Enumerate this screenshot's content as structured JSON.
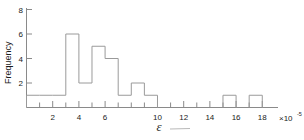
{
  "chart_data": {
    "type": "bar",
    "title": "",
    "subtitle": "",
    "xlabel": "ε",
    "ylabel": "Frequency",
    "x_multiplier": "×10",
    "x_multiplier_exponent": "-5",
    "x_tick_labels": [
      "2",
      "4",
      "6",
      "10",
      "12",
      "14",
      "16",
      "18"
    ],
    "x_tick_values": [
      2,
      4,
      6,
      10,
      12,
      14,
      16,
      18
    ],
    "x_minor_tick_values": [
      1,
      3,
      5,
      7,
      8,
      9,
      11,
      13,
      15,
      17
    ],
    "y_tick_labels": [
      "2",
      "4",
      "6",
      "8"
    ],
    "y_tick_values": [
      2,
      4,
      6,
      8
    ],
    "xlim": [
      0,
      19.2
    ],
    "ylim": [
      0,
      8
    ],
    "grid": false,
    "legend": null,
    "bin_width": 1,
    "bin_edges": [
      0,
      1,
      2,
      3,
      4,
      5,
      6,
      7,
      8,
      9,
      10,
      15,
      16,
      17,
      18
    ],
    "categories": [
      "0-1",
      "1-2",
      "2-3",
      "3-4",
      "4-5",
      "5-6",
      "6-7",
      "7-8",
      "8-9",
      "9-10",
      "15-16",
      "17-18"
    ],
    "bars": [
      {
        "x0": 0,
        "x1": 1,
        "value": 1
      },
      {
        "x0": 1,
        "x1": 2,
        "value": 1
      },
      {
        "x0": 2,
        "x1": 3,
        "value": 1
      },
      {
        "x0": 3,
        "x1": 4,
        "value": 6
      },
      {
        "x0": 4,
        "x1": 5,
        "value": 2
      },
      {
        "x0": 5,
        "x1": 6,
        "value": 5
      },
      {
        "x0": 6,
        "x1": 7,
        "value": 4
      },
      {
        "x0": 7,
        "x1": 8,
        "value": 1
      },
      {
        "x0": 8,
        "x1": 9,
        "value": 2
      },
      {
        "x0": 9,
        "x1": 10,
        "value": 1
      },
      {
        "x0": 15,
        "x1": 16,
        "value": 1
      },
      {
        "x0": 17,
        "x1": 18,
        "value": 1
      }
    ],
    "values": [
      1,
      1,
      1,
      6,
      2,
      5,
      4,
      1,
      2,
      1,
      1,
      1
    ],
    "colors": {
      "bar_stroke": "#9a9a9a",
      "axis": "#8a8a8a",
      "text": "#1a1a1a",
      "background": "#ffffff"
    }
  }
}
